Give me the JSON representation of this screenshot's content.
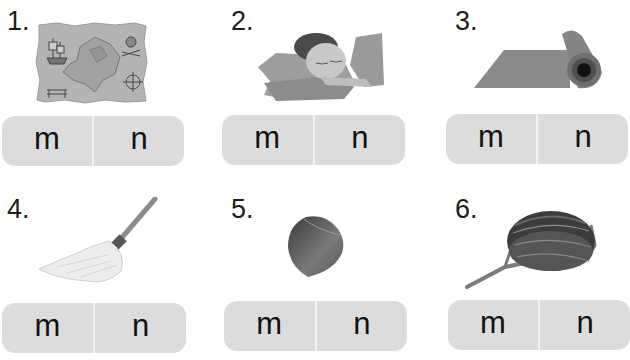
{
  "worksheet": {
    "items": [
      {
        "number": "1.",
        "picture": "treasure-map",
        "options": [
          "m",
          "n"
        ]
      },
      {
        "number": "2.",
        "picture": "sleeping-girl-on-pillow",
        "options": [
          "m",
          "n"
        ]
      },
      {
        "number": "3.",
        "picture": "rolled-yoga-mat",
        "options": [
          "m",
          "n"
        ]
      },
      {
        "number": "4.",
        "picture": "mop",
        "options": [
          "m",
          "n"
        ]
      },
      {
        "number": "5.",
        "picture": "hazelnut",
        "options": [
          "m",
          "n"
        ]
      },
      {
        "number": "6.",
        "picture": "bird-nest",
        "options": [
          "m",
          "n"
        ]
      }
    ]
  },
  "colors": {
    "button_bg": "#dcdcdc",
    "divider": "#f4f4f4",
    "text": "#1a1a1a"
  }
}
